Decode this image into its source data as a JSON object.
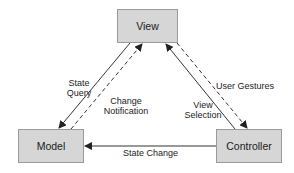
{
  "diagram": {
    "type": "MVC architecture",
    "nodes": {
      "view": {
        "label": "View"
      },
      "model": {
        "label": "Model"
      },
      "controller": {
        "label": "Controller"
      }
    },
    "edges": {
      "state_query": {
        "line1": "State",
        "line2": "Query",
        "from": "View",
        "to": "Model",
        "style": "solid"
      },
      "change_notification": {
        "line1": "Change",
        "line2": "Notification",
        "from": "Model",
        "to": "View",
        "style": "dashed"
      },
      "view_selection": {
        "line1": "View",
        "line2": "Selection",
        "from": "Controller",
        "to": "View",
        "style": "solid"
      },
      "user_gestures": {
        "label": "User Gestures",
        "from": "View",
        "to": "Controller",
        "style": "dashed"
      },
      "state_change": {
        "label": "State Change",
        "from": "Controller",
        "to": "Model",
        "style": "solid"
      }
    },
    "colors": {
      "box_fill": "#d6d6d6",
      "box_border": "#9a9a9a",
      "line": "#333333"
    }
  }
}
